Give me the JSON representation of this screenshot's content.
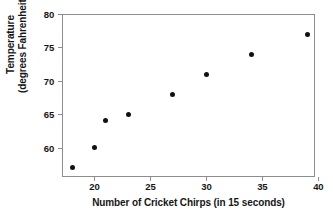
{
  "chart_data": {
    "type": "scatter",
    "title": "",
    "xlabel": "Number of Cricket Chirps (in 15 seconds)",
    "ylabel_line1": "Temperature",
    "ylabel_line2": "(degrees Fahrenheit)",
    "xlim": [
      17.1,
      39.7
    ],
    "ylim": [
      55.6,
      80.0
    ],
    "xticks": [
      20,
      25,
      30,
      35,
      40
    ],
    "yticks": [
      60,
      65,
      70,
      75,
      80
    ],
    "xtick_labels": [
      "20",
      "25",
      "30",
      "35",
      "40"
    ],
    "ytick_labels": [
      "60",
      "65",
      "70",
      "75",
      "80"
    ],
    "grid": false,
    "legend": false,
    "marker": "filled-circle",
    "marker_color": "#111111",
    "frame_color": "#8d8d8d",
    "x": [
      18,
      20,
      21,
      23,
      27,
      30,
      34,
      39
    ],
    "y": [
      57,
      60,
      64,
      65,
      68,
      71,
      74,
      77
    ],
    "points": [
      {
        "x": 18,
        "y": 57
      },
      {
        "x": 20,
        "y": 60
      },
      {
        "x": 21,
        "y": 64
      },
      {
        "x": 23,
        "y": 65
      },
      {
        "x": 27,
        "y": 68
      },
      {
        "x": 30,
        "y": 71
      },
      {
        "x": 34,
        "y": 74
      },
      {
        "x": 39,
        "y": 77
      }
    ]
  }
}
